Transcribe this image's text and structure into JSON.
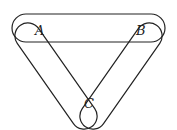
{
  "diagram": {
    "type": "venn-like three elongated loops",
    "labels": {
      "a": "A",
      "b": "B",
      "c": "C"
    },
    "stroke_color": "#222222"
  }
}
